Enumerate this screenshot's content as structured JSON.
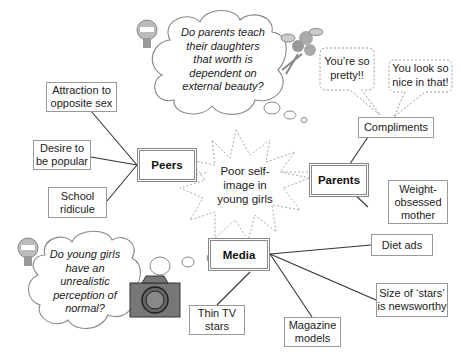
{
  "center": {
    "label": "Poor self-image in young girls",
    "lines": [
      "Poor self-",
      "image in",
      "young girls"
    ]
  },
  "hubs": {
    "peers": "Peers",
    "parents": "Parents",
    "media": "Media"
  },
  "peers_items": [
    {
      "lines": [
        "Attraction to",
        "opposite sex"
      ]
    },
    {
      "lines": [
        "Desire to",
        "be popular"
      ]
    },
    {
      "lines": [
        "School",
        "ridicule"
      ]
    }
  ],
  "parents_items": [
    {
      "lines": [
        "Compliments"
      ]
    },
    {
      "lines": [
        "Weight-",
        "obsessed",
        "mother"
      ]
    }
  ],
  "media_items": [
    {
      "lines": [
        "Diet ads"
      ]
    },
    {
      "lines": [
        "Size of ‘stars’",
        "is newsworthy"
      ]
    },
    {
      "lines": [
        "Magazine",
        "models"
      ]
    },
    {
      "lines": [
        "Thin TV",
        "stars"
      ]
    }
  ],
  "thoughts": {
    "parents_question": [
      "Do parents teach",
      "their daughters",
      "that worth is",
      "dependent on",
      "external beauty?"
    ],
    "media_question": [
      "Do young girls",
      "have an",
      "unrealistic",
      "perception of",
      "normal?"
    ]
  },
  "speech": {
    "bubble1": [
      "You’re so",
      "pretty!!"
    ],
    "bubble2": [
      "You look so",
      "nice in that!"
    ]
  },
  "icons": [
    "lightbulb-icon",
    "lightbulb-icon",
    "flower-bouquet-icon",
    "camera-icon"
  ]
}
